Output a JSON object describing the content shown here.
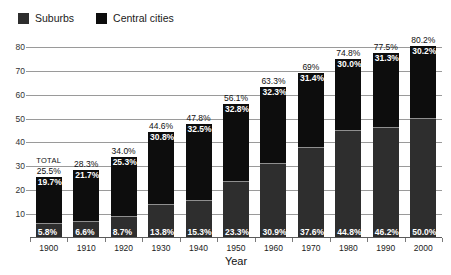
{
  "chart_data": {
    "type": "bar",
    "subtype": "stacked-bar",
    "title": "",
    "xlabel": "Year",
    "ylabel": "",
    "ylim": [
      0,
      85
    ],
    "yticks": [
      10,
      20,
      30,
      40,
      50,
      60,
      70,
      80
    ],
    "grid": true,
    "legend_position": "top-left",
    "categories": [
      "1900",
      "1910",
      "1920",
      "1930",
      "1940",
      "1950",
      "1960",
      "1970",
      "1980",
      "1990",
      "2000"
    ],
    "series": [
      {
        "name": "Suburbs",
        "color": "#2e2e2e",
        "values": [
          5.8,
          6.6,
          8.7,
          13.8,
          15.3,
          23.3,
          30.9,
          37.6,
          44.8,
          46.2,
          50.0
        ],
        "labels": [
          "5.8%",
          "6.6%",
          "8.7%",
          "13.8%",
          "15.3%",
          "23.3%",
          "30.9%",
          "37.6%",
          "44.8%",
          "46.2%",
          "50.0%"
        ]
      },
      {
        "name": "Central cities",
        "color": "#0d0d0d",
        "values": [
          19.7,
          21.7,
          25.3,
          30.8,
          32.5,
          32.8,
          32.3,
          31.4,
          30.0,
          31.3,
          30.2
        ],
        "labels": [
          "19.7%",
          "21.7%",
          "25.3%",
          "30.8%",
          "32.5%",
          "32.8%",
          "32.3%",
          "31.4%",
          "30.0%",
          "31.3%",
          "30.2%"
        ]
      }
    ],
    "totals": [
      25.5,
      28.3,
      34.0,
      44.6,
      47.8,
      56.1,
      63.3,
      69.0,
      74.8,
      77.5,
      80.2
    ],
    "total_labels": [
      "25.5%",
      "28.3%",
      "34.0%",
      "44.6%",
      "47.8%",
      "56.1%",
      "63.3%",
      "69%",
      "74.8%",
      "77.5%",
      "80.2%"
    ],
    "annotations": [
      {
        "text": "TOTAL",
        "category": "1900"
      }
    ]
  },
  "legend": {
    "items": [
      {
        "label": "Suburbs",
        "color": "#2e2e2e"
      },
      {
        "label": "Central cities",
        "color": "#0d0d0d"
      }
    ]
  },
  "axes": {
    "x_title": "Year",
    "y_tick_labels": [
      "10",
      "20",
      "30",
      "40",
      "50",
      "60",
      "70",
      "80"
    ],
    "x_tick_labels": [
      "1900",
      "1910",
      "1920",
      "1930",
      "1940",
      "1950",
      "1960",
      "1970",
      "1980",
      "1990",
      "2000"
    ]
  }
}
